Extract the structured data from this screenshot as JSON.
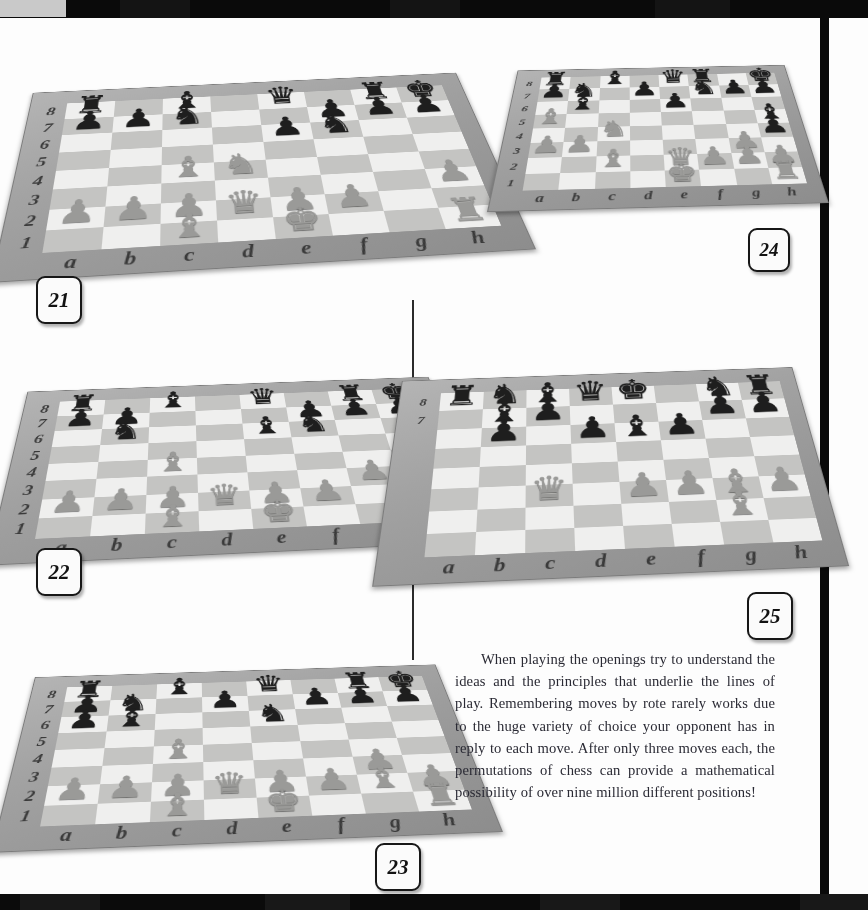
{
  "page": {
    "kind": "scanned-book-page",
    "width": 868,
    "height": 910
  },
  "body_text": {
    "paragraph": "When playing the openings try to understand the ideas and the principles that underlie the lines of play. Remembering moves by rote rarely works due to the huge variety of choice your opponent has in reply to each move. After only three moves each, the permutations of chess can provide a mathematical possibility of over nine million different positions!"
  },
  "coordinates": {
    "files": [
      "a",
      "b",
      "c",
      "d",
      "e",
      "f",
      "g",
      "h"
    ],
    "ranks": [
      "8",
      "7",
      "6",
      "5",
      "4",
      "3",
      "2",
      "1"
    ]
  },
  "colors": {
    "light_square": "#efefee",
    "dark_square": "#c4c4c2",
    "board_frame": "#a2a2a2",
    "black_piece": "#1e1e1e",
    "white_piece": "#9a9a98",
    "rule_black": "#0a0a0a",
    "tag_border": "#171717",
    "text_ink": "#2a2a34"
  },
  "diagrams": [
    {
      "id": "diagram-21",
      "label": "21",
      "ranks_shown": [
        "8",
        "7",
        "6",
        "5",
        "4",
        "3",
        "2",
        "1"
      ],
      "files_shown": [
        "a",
        "b",
        "c",
        "d",
        "e",
        "f",
        "g",
        "h"
      ],
      "position": [
        [
          "r",
          "",
          "b",
          "",
          "q",
          "",
          "r",
          "k"
        ],
        [
          "p",
          "p",
          "n",
          "",
          "",
          "p",
          "p",
          "p"
        ],
        [
          "",
          "",
          "",
          "",
          "p",
          "n",
          "",
          ""
        ],
        [
          "",
          "",
          "",
          "",
          "",
          "",
          "",
          ""
        ],
        [
          "",
          "",
          "B",
          "N",
          "",
          "",
          "",
          ""
        ],
        [
          "",
          "",
          "",
          "",
          "",
          "",
          "",
          "P"
        ],
        [
          "P",
          "P",
          "P",
          "Q",
          "P",
          "P",
          "",
          ""
        ],
        [
          "",
          "",
          "B",
          "",
          "K",
          "",
          "",
          "R"
        ]
      ]
    },
    {
      "id": "diagram-22",
      "label": "22",
      "ranks_shown": [
        "8",
        "7",
        "6",
        "5",
        "4",
        "3",
        "2",
        "1"
      ],
      "files_shown": [
        "a",
        "b",
        "c",
        "d",
        "e",
        "f",
        "g",
        "h"
      ],
      "position": [
        [
          "r",
          "",
          "b",
          "",
          "q",
          "",
          "r",
          "k"
        ],
        [
          "p",
          "p",
          "",
          "",
          "",
          "p",
          "p",
          "p"
        ],
        [
          "",
          "n",
          "",
          "",
          "b",
          "n",
          "",
          ""
        ],
        [
          "",
          "",
          "",
          "",
          "",
          "",
          "",
          ""
        ],
        [
          "",
          "",
          "B",
          "",
          "",
          "",
          "",
          ""
        ],
        [
          "",
          "",
          "",
          "",
          "",
          "",
          "P",
          ""
        ],
        [
          "P",
          "P",
          "P",
          "Q",
          "P",
          "P",
          "",
          "P"
        ],
        [
          "",
          "",
          "B",
          "",
          "K",
          "",
          "",
          "R"
        ]
      ]
    },
    {
      "id": "diagram-23",
      "label": "23",
      "ranks_shown": [
        "8",
        "7",
        "6",
        "5",
        "4",
        "3",
        "2",
        "1"
      ],
      "files_shown": [
        "a",
        "b",
        "c",
        "d",
        "e",
        "f",
        "g",
        "h"
      ],
      "position": [
        [
          "r",
          "",
          "b",
          "",
          "q",
          "",
          "r",
          "k"
        ],
        [
          "p",
          "n",
          "",
          "p",
          "",
          "p",
          "p",
          "p"
        ],
        [
          "p",
          "b",
          "",
          "",
          "n",
          "",
          "",
          ""
        ],
        [
          "",
          "",
          "",
          "",
          "",
          "",
          "",
          ""
        ],
        [
          "",
          "",
          "B",
          "",
          "",
          "",
          "",
          ""
        ],
        [
          "",
          "",
          "",
          "",
          "",
          "",
          "P",
          ""
        ],
        [
          "P",
          "P",
          "P",
          "Q",
          "P",
          "P",
          "B",
          "P"
        ],
        [
          "",
          "",
          "B",
          "",
          "K",
          "",
          "",
          "R"
        ]
      ]
    },
    {
      "id": "diagram-24",
      "label": "24",
      "ranks_shown": [
        "8",
        "7",
        "6",
        "5",
        "4",
        "3",
        "2",
        "1"
      ],
      "files_shown": [
        "a",
        "b",
        "c",
        "d",
        "e",
        "f",
        "g",
        "h"
      ],
      "position": [
        [
          "r",
          "",
          "b",
          "",
          "q",
          "r",
          "",
          "k"
        ],
        [
          "p",
          "n",
          "",
          "p",
          "",
          "n",
          "p",
          "p"
        ],
        [
          "",
          "b",
          "",
          "",
          "p",
          "",
          "",
          ""
        ],
        [
          "B",
          "",
          "",
          "",
          "",
          "",
          "",
          "b"
        ],
        [
          "",
          "",
          "N",
          "",
          "",
          "",
          "",
          "p"
        ],
        [
          "P",
          "P",
          "",
          "",
          "",
          "",
          "P",
          ""
        ],
        [
          "",
          "",
          "B",
          "",
          "Q",
          "P",
          "P",
          "P"
        ],
        [
          "",
          "",
          "",
          "",
          "K",
          "",
          "",
          "R"
        ]
      ]
    },
    {
      "id": "diagram-25",
      "label": "25",
      "ranks_shown": [
        "8",
        "7"
      ],
      "files_shown": [
        "a",
        "b",
        "c",
        "d",
        "e",
        "f",
        "g",
        "h"
      ],
      "note": "close-up detail view overlapping diagram 22",
      "position": [
        [
          "r",
          "n",
          "b",
          "q",
          "k",
          "",
          "n",
          "r"
        ],
        [
          "",
          "b",
          "p",
          "",
          "",
          "",
          "p",
          "p"
        ],
        [
          "",
          "p",
          "",
          "p",
          "b",
          "p",
          "",
          ""
        ],
        [
          "",
          "",
          "",
          "",
          "",
          "",
          "",
          ""
        ],
        [
          "",
          "",
          "",
          "",
          "",
          "",
          "",
          ""
        ],
        [
          "",
          "",
          "Q",
          "",
          "P",
          "P",
          "B",
          "P"
        ],
        [
          "",
          "",
          "",
          "",
          "",
          "",
          "B",
          ""
        ],
        [
          "",
          "",
          "",
          "",
          "",
          "",
          "",
          ""
        ]
      ]
    }
  ]
}
